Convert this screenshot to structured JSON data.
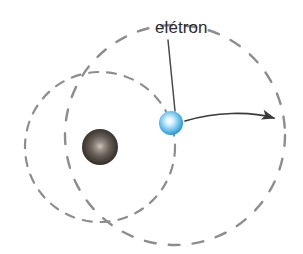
{
  "figure": {
    "kind": "atom-orbit-diagram",
    "background_color": "#ffffff",
    "width": 303,
    "height": 254
  },
  "labels": {
    "electron_label": "elétron"
  },
  "colors": {
    "label_text": "#2b2b2b",
    "orbit_dash": "#8d8d8d",
    "arrow": "#3a3a3a",
    "leader_line": "#4a4a4a",
    "electron_core": "#ffffff",
    "electron_mid": "#7ec8ef",
    "electron_edge": "#1f8fd0",
    "nucleus_core": "#b9b2a8",
    "nucleus_mid": "#5d554e",
    "nucleus_edge": "#241f1c"
  },
  "geometry": {
    "nucleus": {
      "cx": 100,
      "cy": 147,
      "r": 18
    },
    "electron": {
      "cx": 171,
      "cy": 123,
      "r": 12
    },
    "inner_orbit": {
      "cx": 100,
      "cy": 147,
      "r": 75,
      "dash": "9 9"
    },
    "outer_orbit": {
      "cx": 175,
      "cy": 135,
      "r": 110,
      "dash": "11 13"
    },
    "leader_line": {
      "x1": 168,
      "y1": 40,
      "x2": 175,
      "y2": 111
    },
    "transition_arrow": {
      "path": "M 185 121 C 215 112, 250 111, 276 118",
      "tip": {
        "x": 280,
        "y": 119
      }
    }
  },
  "elements": {
    "nucleus_name": "nucleus",
    "electron_name": "electron",
    "inner_orbit_name": "inner-orbit",
    "outer_orbit_name": "outer-orbit",
    "arrow_name": "electron-transition-arrow",
    "leader_name": "electron-leader-line"
  }
}
